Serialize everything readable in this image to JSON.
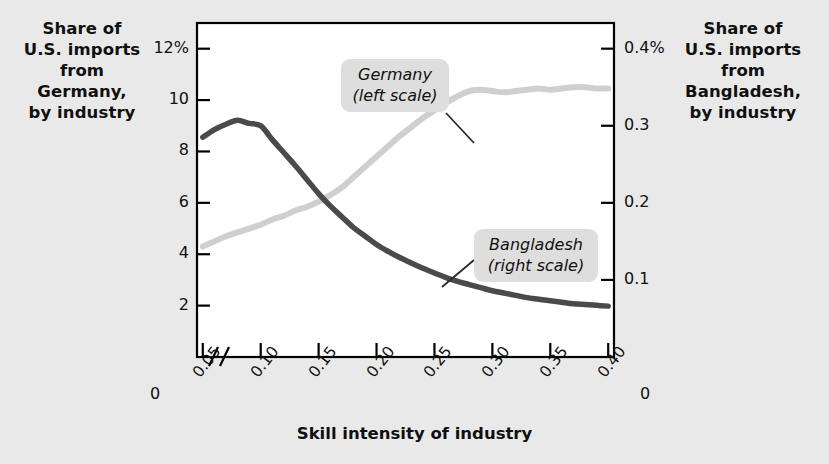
{
  "figure": {
    "background_color": "#e9e9e9",
    "plot_background_color": "#ffffff",
    "left_axis_title": "Share of\nU.S. imports\nfrom\nGermany,\nby industry",
    "right_axis_title": "Share of\nU.S. imports\nfrom\nBangladesh,\nby industry",
    "x_axis_title": "Skill intensity of industry",
    "left_zero_label": "0",
    "right_zero_label": "0"
  },
  "chart_data": {
    "type": "line",
    "title": "",
    "xlabel": "Skill intensity of industry",
    "ylabel": "Share of U.S. imports from Germany, by industry",
    "y2label": "Share of U.S. imports from Bangladesh, by industry",
    "grid": false,
    "legend": "annotations-on-plot",
    "x": [
      0.05,
      0.06,
      0.07,
      0.08,
      0.09,
      0.1,
      0.11,
      0.12,
      0.13,
      0.14,
      0.15,
      0.16,
      0.17,
      0.18,
      0.19,
      0.2,
      0.21,
      0.22,
      0.23,
      0.24,
      0.25,
      0.26,
      0.27,
      0.28,
      0.29,
      0.3,
      0.31,
      0.32,
      0.33,
      0.34,
      0.35,
      0.36,
      0.37,
      0.38,
      0.39,
      0.4
    ],
    "x_tick_labels": [
      "0.05",
      "0.10",
      "0.15",
      "0.20",
      "0.25",
      "0.30",
      "0.35",
      "0.40"
    ],
    "x_tick_values": [
      0.05,
      0.1,
      0.15,
      0.2,
      0.25,
      0.3,
      0.35,
      0.4
    ],
    "xlim": [
      0.045,
      0.405
    ],
    "axis_break": true,
    "axis_break_symbol": "//",
    "left_axis": {
      "tick_labels": [
        "12%",
        "10",
        "8",
        "6",
        "4",
        "2"
      ],
      "tick_values": [
        12,
        10,
        8,
        6,
        4,
        2
      ],
      "zero_label": "0",
      "ylim": [
        0,
        13
      ]
    },
    "right_axis": {
      "tick_labels": [
        "0.4%",
        "0.3",
        "0.2",
        "0.1"
      ],
      "tick_values": [
        0.4,
        0.3,
        0.2,
        0.1
      ],
      "zero_label": "0",
      "ylim": [
        0,
        0.4333
      ]
    },
    "series": [
      {
        "name": "Germany (left scale)",
        "axis": "left",
        "color": "#cfcfcf",
        "annotation": "Germany\n(left scale)",
        "annotation_line1": "Germany",
        "annotation_line2": "(left scale)",
        "values": [
          4.3,
          4.5,
          4.7,
          4.85,
          5.0,
          5.15,
          5.35,
          5.5,
          5.7,
          5.85,
          6.05,
          6.3,
          6.6,
          7.0,
          7.4,
          7.8,
          8.2,
          8.6,
          8.95,
          9.3,
          9.6,
          9.9,
          10.15,
          10.35,
          10.4,
          10.35,
          10.3,
          10.35,
          10.4,
          10.45,
          10.4,
          10.45,
          10.5,
          10.5,
          10.45,
          10.45
        ]
      },
      {
        "name": "Bangladesh (right scale)",
        "axis": "right",
        "color": "#4a4a4a",
        "annotation": "Bangladesh\n(right scale)",
        "annotation_line1": "Bangladesh",
        "annotation_line2": "(right scale)",
        "values": [
          0.285,
          0.295,
          0.302,
          0.307,
          0.303,
          0.3,
          0.282,
          0.265,
          0.248,
          0.23,
          0.212,
          0.196,
          0.182,
          0.168,
          0.157,
          0.146,
          0.137,
          0.129,
          0.122,
          0.115,
          0.109,
          0.103,
          0.098,
          0.094,
          0.09,
          0.086,
          0.083,
          0.08,
          0.077,
          0.075,
          0.073,
          0.071,
          0.069,
          0.068,
          0.067,
          0.066
        ]
      }
    ]
  }
}
